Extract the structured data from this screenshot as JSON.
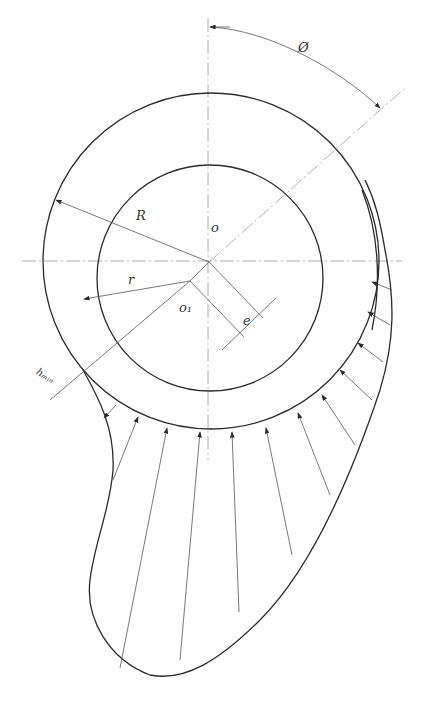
{
  "diagram": {
    "labels": {
      "phi": "Ø",
      "R": "R",
      "O": "o",
      "r": "r",
      "O1": "o₁",
      "e": "e",
      "hmin": "hₘᵢₙ"
    },
    "geometry": {
      "bearing_center": [
        211,
        261
      ],
      "bearing_radius": 168,
      "journal_center": [
        191,
        281
      ],
      "journal_radius": 113,
      "stroke_color": "#2a2a2a",
      "centerline_color": "#9a9a9a"
    },
    "pressure_arrow_count": 12
  }
}
